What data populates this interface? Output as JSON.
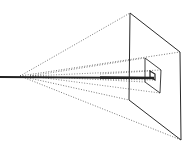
{
  "diagram": {
    "title": "",
    "background": "#ffffff",
    "stroke_color": "#2a2a2a",
    "dotted_color": "#555555",
    "apex": {
      "x": 20,
      "y": 76
    },
    "ray": {
      "x1": 0,
      "y1": 77,
      "x2": 154,
      "y2": 78
    },
    "large_plane": [
      [
        130,
        13
      ],
      [
        180,
        52
      ],
      [
        181,
        140
      ],
      [
        129,
        100
      ]
    ],
    "small_plane": [
      [
        145,
        58
      ],
      [
        161,
        70
      ],
      [
        160,
        93
      ],
      [
        145,
        82
      ]
    ],
    "tiny_square": [
      [
        150,
        71
      ],
      [
        155,
        74
      ],
      [
        155,
        80
      ],
      [
        150,
        77
      ]
    ]
  }
}
